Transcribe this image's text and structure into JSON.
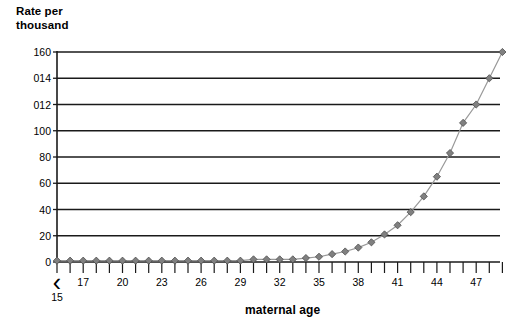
{
  "chart_data": {
    "type": "line",
    "title": "",
    "ylabel": "Rate per thousand",
    "xlabel": "maternal age",
    "ylim": [
      0,
      160
    ],
    "grid": true,
    "legend": "none",
    "marker": "diamond",
    "marker_color": "#808080",
    "line_color": "#999999",
    "ytick_labels": [
      "160",
      "014",
      "012",
      "100",
      "80",
      "60",
      "40",
      "20",
      "0"
    ],
    "ytick_values": [
      160,
      140,
      120,
      100,
      80,
      60,
      40,
      20,
      0
    ],
    "xtick_labels": [
      "<15",
      "17",
      "20",
      "23",
      "26",
      "29",
      "32",
      "35",
      "38",
      "41",
      "44",
      "47"
    ],
    "x_category_first": "<15",
    "x_under15_glyph": "‹",
    "x_under15_value": "15",
    "categories": [
      "<15",
      "16",
      "17",
      "18",
      "19",
      "20",
      "21",
      "22",
      "23",
      "24",
      "25",
      "26",
      "27",
      "28",
      "29",
      "30",
      "31",
      "32",
      "33",
      "34",
      "35",
      "36",
      "37",
      "38",
      "39",
      "40",
      "41",
      "42",
      "43",
      "44",
      "45",
      "46",
      "47",
      "48",
      "49"
    ],
    "values": [
      1,
      1,
      1,
      1,
      1,
      1,
      1,
      1,
      1,
      1,
      1,
      1,
      1,
      1,
      1,
      2,
      2,
      2,
      2,
      3,
      4,
      6,
      8,
      11,
      15,
      21,
      28,
      38,
      50,
      65,
      83,
      106,
      120,
      140,
      160
    ],
    "x_axis_note": "ticks every year; labels every 3rd year",
    "n_points": 35
  },
  "y_axis_title": {
    "line1": "Rate per",
    "line2": "thousand"
  },
  "x_axis_title": {
    "label": "maternal age"
  }
}
